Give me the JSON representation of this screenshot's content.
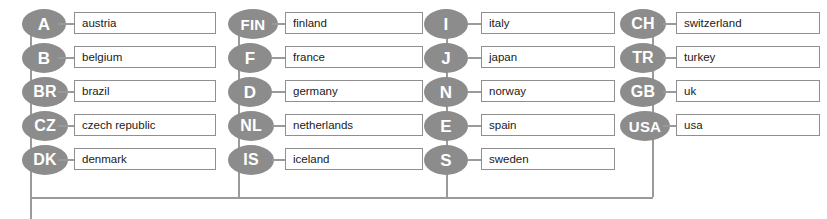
{
  "diagram": {
    "type": "tree",
    "node_color": "#8c8c8c",
    "node_text_color": "#ffffff",
    "line_color": "#9a9a9a",
    "box_border_color": "#8f8f8f",
    "box_fill_color": "#ffffff",
    "label_text_color": "#1a1a1a",
    "background": "#ffffff"
  },
  "columns": [
    {
      "name": "column-1",
      "x": 22,
      "line_x": 30,
      "stub_x": 58,
      "stub_w": 16,
      "box_x": 74,
      "box_w": 142,
      "nodes": [
        {
          "code": "A",
          "label": "austria",
          "size": "w-sm"
        },
        {
          "code": "B",
          "label": "belgium",
          "size": "w-sm"
        },
        {
          "code": "BR",
          "label": "brazil",
          "size": "w-md"
        },
        {
          "code": "CZ",
          "label": "czech republic",
          "size": "w-md"
        },
        {
          "code": "DK",
          "label": "denmark",
          "size": "w-md"
        }
      ]
    },
    {
      "name": "column-2",
      "x": 228,
      "line_x": 238,
      "stub_x": 272,
      "stub_w": 13,
      "box_x": 285,
      "box_w": 138,
      "nodes": [
        {
          "code": "FIN",
          "label": "finland",
          "size": "w-lg"
        },
        {
          "code": "F",
          "label": "france",
          "size": "w-sm"
        },
        {
          "code": "D",
          "label": "germany",
          "size": "w-sm"
        },
        {
          "code": "NL",
          "label": "netherlands",
          "size": "w-md"
        },
        {
          "code": "IS",
          "label": "iceland",
          "size": "w-md"
        }
      ]
    },
    {
      "name": "column-3",
      "x": 424,
      "line_x": 446,
      "stub_x": 468,
      "stub_w": 13,
      "box_x": 481,
      "box_w": 134,
      "nodes": [
        {
          "code": "I",
          "label": "italy",
          "size": "w-sm"
        },
        {
          "code": "J",
          "label": "japan",
          "size": "w-sm"
        },
        {
          "code": "N",
          "label": "norway",
          "size": "w-sm"
        },
        {
          "code": "E",
          "label": "spain",
          "size": "w-sm"
        },
        {
          "code": "S",
          "label": "sweden",
          "size": "w-sm"
        }
      ]
    },
    {
      "name": "column-4",
      "x": 620,
      "line_x": 652,
      "stub_x": 663,
      "stub_w": 13,
      "box_x": 676,
      "box_w": 144,
      "nodes": [
        {
          "code": "CH",
          "label": "switzerland",
          "size": "w-md"
        },
        {
          "code": "TR",
          "label": "turkey",
          "size": "w-md"
        },
        {
          "code": "GB",
          "label": "uk",
          "size": "w-md"
        },
        {
          "code": "USA",
          "label": "usa",
          "size": "w-lg"
        }
      ]
    }
  ],
  "layout": {
    "row_top_start": 9,
    "row_spacing": 34,
    "bus_y": 197,
    "bus_left": 30,
    "bus_right": 653,
    "trunk_x": 30,
    "trunk_bottom": 219
  }
}
